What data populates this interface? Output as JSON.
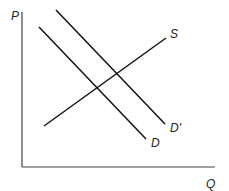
{
  "diagram": {
    "type": "supply-demand",
    "axes": {
      "y_label": "P",
      "x_label": "Q"
    },
    "curves": [
      {
        "name": "S",
        "label": "S",
        "from": [
          44,
          126
        ],
        "to": [
          166,
          38
        ]
      },
      {
        "name": "D",
        "label": "D",
        "from": [
          39,
          27
        ],
        "to": [
          146,
          139
        ]
      },
      {
        "name": "D_prime",
        "label": "D'",
        "from": [
          56,
          10
        ],
        "to": [
          165,
          124
        ]
      }
    ]
  }
}
